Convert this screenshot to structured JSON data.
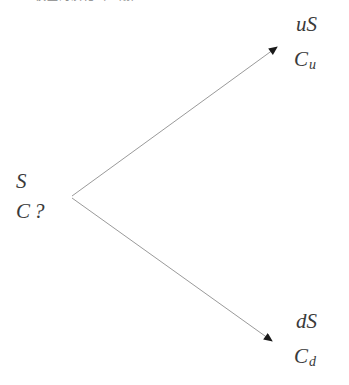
{
  "figure": {
    "width": 349,
    "height": 385,
    "background_color": "#ffffff",
    "type": "binomial-tree",
    "caption_sliver_text": "模型的演化（一期）"
  },
  "style": {
    "line_color": "#9a9a9a",
    "arrowhead_color": "#1a1a1a",
    "text_color": "#3a3a3a",
    "line_width": 1
  },
  "nodes": {
    "root": {
      "asset_label": "S",
      "option_label": "C",
      "option_unknown_marker": "?",
      "x": 72,
      "y": 197
    },
    "up": {
      "asset_label": "uS",
      "option_base": "C",
      "option_subscript": "u",
      "x": 283,
      "y": 43
    },
    "down": {
      "asset_label": "dS",
      "option_base": "C",
      "option_subscript": "d",
      "x": 278,
      "y": 345
    }
  },
  "edges": [
    {
      "name": "up-branch",
      "from_x": 72,
      "from_y": 197,
      "to_x": 283,
      "to_y": 43
    },
    {
      "name": "down-branch",
      "from_x": 72,
      "from_y": 197,
      "to_x": 278,
      "to_y": 345
    }
  ]
}
